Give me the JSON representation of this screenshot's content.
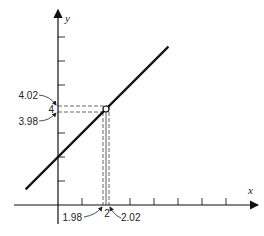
{
  "diagram": {
    "type": "function-graph",
    "line": {
      "slope": 1,
      "intercept": 2,
      "x_from": -1.35,
      "x_to": 4.6
    },
    "point": {
      "x": 2,
      "y": 4
    },
    "axes": {
      "x_label": "x",
      "y_label": "y",
      "x_ticks": [
        1,
        2,
        3,
        4,
        5,
        6,
        7
      ],
      "y_ticks": [
        1,
        2,
        3,
        4,
        5,
        6,
        7
      ]
    },
    "x_marks": {
      "low": 1.98,
      "center": 2,
      "high": 2.02
    },
    "y_marks": {
      "low": 3.98,
      "center": 4,
      "high": 4.02
    },
    "labels": {
      "x_low": "1.98",
      "x_center": "2",
      "x_high": "2.02",
      "y_low": "3.98",
      "y_center": "4",
      "y_high": "4.02"
    },
    "colors": {
      "ink": "#111111",
      "dash": "#555555"
    }
  }
}
